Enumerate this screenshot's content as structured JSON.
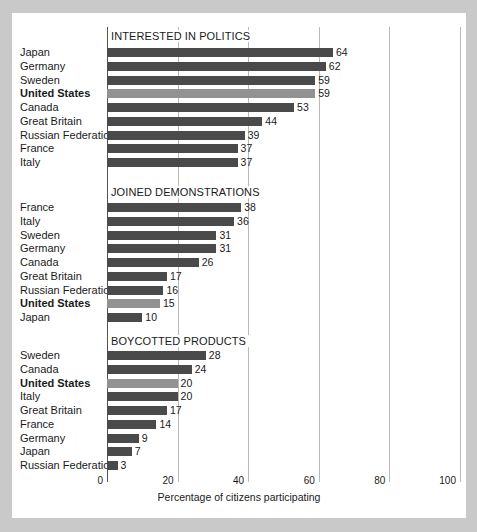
{
  "chart_data": {
    "type": "bar",
    "title": "",
    "xlabel": "Percentage of citizens participating",
    "ylabel": "",
    "xlim": [
      0,
      100
    ],
    "xticks": [
      0,
      20,
      40,
      60,
      80,
      100
    ],
    "grid": true,
    "orientation": "horizontal",
    "legend": null,
    "highlight_category": "United States",
    "colors": {
      "bar": "#4a4a4a",
      "bar_highlight": "#929292",
      "gridline": "#b9b9b9",
      "axis": "#555555",
      "text": "#1a1a1a",
      "panel_background": "#ffffff",
      "page_background": "#c9c9c9"
    },
    "panels": [
      {
        "title": "INTERESTED IN POLITICS",
        "categories": [
          "Japan",
          "Germany",
          "Sweden",
          "United States",
          "Canada",
          "Great Britain",
          "Russian Federation",
          "France",
          "Italy"
        ],
        "values": [
          64,
          62,
          59,
          59,
          53,
          44,
          39,
          37,
          37
        ],
        "highlighted": [
          false,
          false,
          false,
          true,
          false,
          false,
          false,
          false,
          false
        ]
      },
      {
        "title": "JOINED DEMONSTRATIONS",
        "categories": [
          "France",
          "Italy",
          "Sweden",
          "Germany",
          "Canada",
          "Great Britain",
          "Russian Federation",
          "United States",
          "Japan"
        ],
        "values": [
          38,
          36,
          31,
          31,
          26,
          17,
          16,
          15,
          10
        ],
        "highlighted": [
          false,
          false,
          false,
          false,
          false,
          false,
          false,
          true,
          false
        ]
      },
      {
        "title": "BOYCOTTED PRODUCTS",
        "categories": [
          "Sweden",
          "Canada",
          "United States",
          "Italy",
          "Great Britain",
          "France",
          "Germany",
          "Japan",
          "Russian Federation"
        ],
        "values": [
          28,
          24,
          20,
          20,
          17,
          14,
          9,
          7,
          3
        ],
        "highlighted": [
          false,
          false,
          true,
          false,
          false,
          false,
          false,
          false,
          false
        ]
      }
    ]
  }
}
